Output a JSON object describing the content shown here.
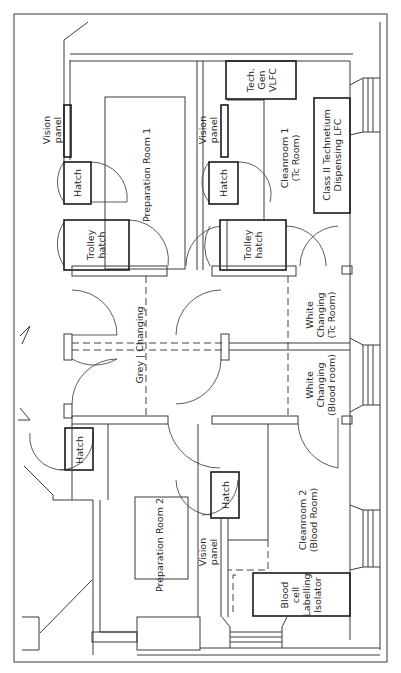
{
  "diagram": {
    "type": "floor-plan",
    "orientation": "rotated-90",
    "labels": {
      "vision_panel_top_left": [
        "Vision",
        "panel"
      ],
      "vision_panel_top_mid": [
        "Vision",
        "panel"
      ],
      "vision_panel_bottom": [
        "Vision",
        "panel"
      ],
      "preparation_room_1": "Preparation Room 1",
      "preparation_room_2": "Preparation Room 2",
      "hatch_top_left": "Hatch",
      "hatch_top_mid": "Hatch",
      "hatch_bottom_left": "Hatch",
      "hatch_bottom_mid": "Hatch",
      "trolley_hatch_left": [
        "Trolley",
        "hatch"
      ],
      "trolley_hatch_right": [
        "Trolley",
        "hatch"
      ],
      "tech_gen_vlfc": [
        "Tech.",
        "Gen",
        "VLFC"
      ],
      "cleanroom_1": [
        "Cleanroom 1",
        "(Tc Room)"
      ],
      "class_ii_lfc": [
        "Class II Technetium",
        "Dispensing LFC"
      ],
      "grey_changing": "Grey | Changing",
      "white_changing_tc": [
        "White",
        "Changing",
        "(Tc Room)"
      ],
      "white_changing_blood": [
        "White",
        "Changing",
        "(Blood room)"
      ],
      "cleanroom_2": [
        "Cleanroom 2",
        "(Blood Room)"
      ],
      "blood_cell_isolator": [
        "Blood",
        "cell",
        "Labelling",
        "Isolator"
      ]
    }
  }
}
